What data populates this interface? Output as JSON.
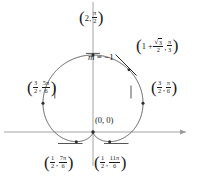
{
  "figure": {
    "name": "polar-cardioid-plot",
    "curve_equation": "r = 1 + sin(theta)",
    "colors": {
      "curve": "#3a3a3a",
      "axis": "#8a8a8a",
      "text": "#1a1a1a",
      "background": "#ffffff"
    }
  },
  "chart_data": {
    "type": "line",
    "title": "",
    "xlabel": "",
    "ylabel": "",
    "curve": "cardioid r = 1 + sin(theta)",
    "xlim": [
      -2.2,
      2.4
    ],
    "ylim": [
      -0.6,
      2.4
    ],
    "grid": false,
    "legend": "none",
    "annotations": [
      {
        "name": "slope-annotation",
        "text": "m = -1",
        "x": 0.45,
        "y": 1.35
      }
    ],
    "points": [
      {
        "id": "top",
        "r": 2,
        "theta": "pi/2",
        "x": 0.0,
        "y": 2.0,
        "label": "(2, pi/2)"
      },
      {
        "id": "pi-over-3",
        "r": "1 + sqrt3/2",
        "theta": "pi/3",
        "x": 0.933,
        "y": 1.616,
        "label": "(1 + sqrt(3)/2, pi/3)"
      },
      {
        "id": "pi-over-6",
        "r": "3/2",
        "theta": "pi/6",
        "x": 1.299,
        "y": 0.75,
        "label": "(3/2, pi/6)"
      },
      {
        "id": "5pi-over-6",
        "r": "3/2",
        "theta": "5pi/6",
        "x": -1.299,
        "y": 0.75,
        "label": "(3/2, 5pi/6)"
      },
      {
        "id": "origin",
        "r": 0,
        "theta": "3pi/2",
        "x": 0.0,
        "y": 0.0,
        "label": "(0, 0)"
      },
      {
        "id": "7pi-over-6",
        "r": "1/2",
        "theta": "7pi/6",
        "x": -0.433,
        "y": -0.25,
        "label": "(1/2, 7pi/6)"
      },
      {
        "id": "11pi-over-6",
        "r": "1/2",
        "theta": "11pi/6",
        "x": 0.433,
        "y": -0.25,
        "label": "(1/2, 11pi/6)"
      }
    ]
  },
  "labels": {
    "top": {
      "open": "(",
      "r": "2",
      "comma": ",",
      "theta_num": "π",
      "theta_den": "2",
      "close": ")"
    },
    "pi3": {
      "open": "(",
      "lead": "1 +",
      "rad_sign": "√",
      "rad_arg": "3",
      "r_den": "2",
      "comma": ",",
      "theta_num": "π",
      "theta_den": "3",
      "close": ")"
    },
    "pi6": {
      "open": "(",
      "r_num": "3",
      "r_den": "2",
      "comma": ",",
      "theta_num": "π",
      "theta_den": "6",
      "close": ")"
    },
    "fivepi6": {
      "open": "(",
      "r_num": "3",
      "r_den": "2",
      "comma": ",",
      "theta_num": "5π",
      "theta_den": "6",
      "close": ")"
    },
    "origin": {
      "text": "(0, 0)"
    },
    "sevenpi6": {
      "open": "(",
      "r_num": "1",
      "r_den": "2",
      "comma": ",",
      "theta_num": "7π",
      "theta_den": "6",
      "close": ")"
    },
    "elevenpi6": {
      "open": "(",
      "r_num": "1",
      "r_den": "2",
      "comma": ",",
      "theta_num": "11π",
      "theta_den": "6",
      "close": ")"
    },
    "slope": {
      "var": "m",
      "eq": "=",
      "value": "−1"
    }
  }
}
